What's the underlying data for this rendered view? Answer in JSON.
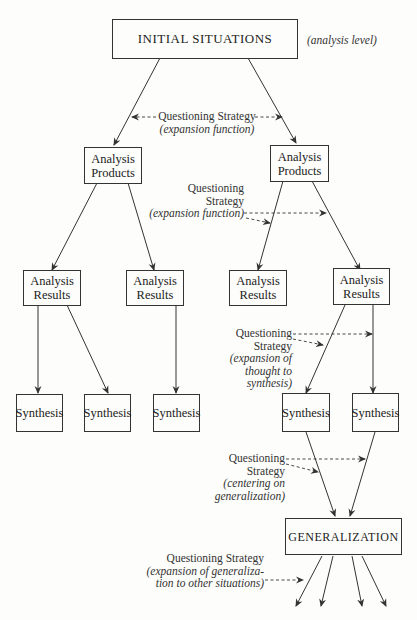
{
  "diagram": {
    "root": {
      "label": "INITIAL SITUATIONS",
      "side_note": "(analysis level)"
    },
    "products": [
      {
        "line1": "Analysis",
        "line2": "Products"
      },
      {
        "line1": "Analysis",
        "line2": "Products"
      }
    ],
    "results": [
      {
        "line1": "Analysis",
        "line2": "Results"
      },
      {
        "line1": "Analysis",
        "line2": "Results"
      },
      {
        "line1": "Analysis",
        "line2": "Results"
      },
      {
        "line1": "Analysis",
        "line2": "Results"
      }
    ],
    "synthesis": [
      {
        "label": "Synthesis"
      },
      {
        "label": "Synthesis"
      },
      {
        "label": "Synthesis"
      },
      {
        "label": "Synthesis"
      },
      {
        "label": "Synthesis"
      }
    ],
    "generalization": {
      "label": "GENERALIZATION"
    },
    "strategies": [
      {
        "title": "Questioning Strategy",
        "function": "(expansion function)"
      },
      {
        "line1": "Questioning",
        "line2": "Strategy",
        "function": "(expansion function)"
      },
      {
        "line1": "Questioning",
        "line2": "Strategy",
        "f1": "(expansion of",
        "f2": "thought to",
        "f3": "synthesis)"
      },
      {
        "line1": "Questioning",
        "line2": "Strategy",
        "f1": "(centering on",
        "f2": "generalization)"
      },
      {
        "title": "Questioning Strategy",
        "f1": "(expansion of generaliza-",
        "f2": "tion to other situations)"
      }
    ],
    "colors": {
      "line": "#333333",
      "background": "#fdfdfb",
      "text": "#222222"
    }
  }
}
